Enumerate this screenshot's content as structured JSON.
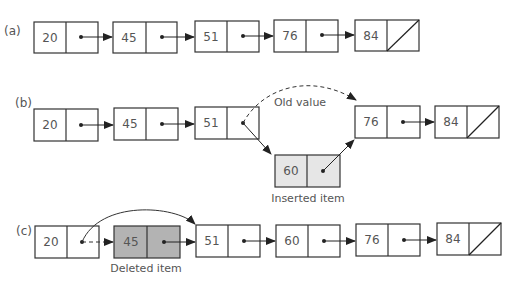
{
  "diagrams": [
    {
      "label": "(a)",
      "nodes": [
        {
          "value": "20",
          "next": "pointer"
        },
        {
          "value": "45",
          "next": "pointer"
        },
        {
          "value": "51",
          "next": "pointer"
        },
        {
          "value": "76",
          "next": "pointer"
        },
        {
          "value": "84",
          "next": "null"
        }
      ]
    },
    {
      "label": "(b)",
      "nodes": [
        {
          "value": "20",
          "next": "pointer"
        },
        {
          "value": "45",
          "next": "pointer"
        },
        {
          "value": "51",
          "next": "pointer-to-inserted"
        },
        {
          "value": "76",
          "next": "pointer"
        },
        {
          "value": "84",
          "next": "null"
        }
      ],
      "inserted_node": {
        "value": "60",
        "next": "pointer-to-76",
        "fill": "#e6e6e6"
      },
      "old_value_label": "Old value",
      "inserted_caption": "Inserted item"
    },
    {
      "label": "(c)",
      "nodes": [
        {
          "value": "20",
          "next": "bypass-pointer"
        },
        {
          "value": "45",
          "next": "pointer",
          "deleted": true,
          "fill": "#b3b3b3"
        },
        {
          "value": "51",
          "next": "pointer"
        },
        {
          "value": "60",
          "next": "pointer"
        },
        {
          "value": "76",
          "next": "pointer"
        },
        {
          "value": "84",
          "next": "null"
        }
      ],
      "deleted_caption": "Deleted item"
    }
  ],
  "colors": {
    "stroke": "#333333",
    "text": "#555555",
    "inserted_fill": "#e6e6e6",
    "deleted_fill": "#b3b3b3"
  }
}
